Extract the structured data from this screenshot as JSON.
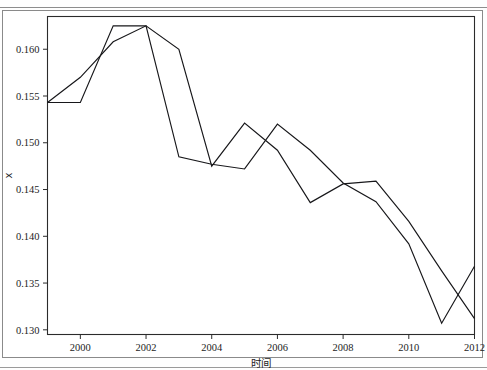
{
  "figure": {
    "y_axis_label": "x",
    "x_axis_label": "时间"
  },
  "chart_data": {
    "type": "line",
    "title": "",
    "subtitle": "",
    "xlabel": "时间",
    "ylabel": "x",
    "xlim": [
      1999,
      2012
    ],
    "ylim": [
      0.1295,
      0.1635
    ],
    "grid": false,
    "legend": false,
    "legend_position": "none",
    "x_ticks": [
      2000,
      2002,
      2004,
      2006,
      2008,
      2010,
      2012
    ],
    "x_tick_labels": [
      "2000",
      "2002",
      "2004",
      "2006",
      "2008",
      "2010",
      "2012"
    ],
    "y_ticks": [
      0.13,
      0.135,
      0.14,
      0.145,
      0.15,
      0.155,
      0.16
    ],
    "y_tick_labels": [
      "0.130",
      "0.135",
      "0.140",
      "0.145",
      "0.150",
      "0.155",
      "0.160"
    ],
    "x": [
      1999,
      2000,
      2001,
      2002,
      2003,
      2004,
      2005,
      2006,
      2007,
      2008,
      2009,
      2010,
      2011,
      2012
    ],
    "series": [
      {
        "name": "series-1",
        "color": "#17171a",
        "values": [
          0.1543,
          0.1543,
          0.1625,
          0.1625,
          0.1485,
          0.1477,
          0.1472,
          0.152,
          0.1492,
          0.1457,
          0.1437,
          0.1392,
          0.1307,
          0.1368
        ]
      },
      {
        "name": "series-2",
        "color": "#17171a",
        "values": [
          0.1543,
          0.157,
          0.1608,
          0.1625,
          0.16,
          0.1475,
          0.1521,
          0.1492,
          0.1436,
          0.1456,
          0.1459,
          0.1416,
          0.1363,
          0.1312
        ]
      }
    ]
  }
}
